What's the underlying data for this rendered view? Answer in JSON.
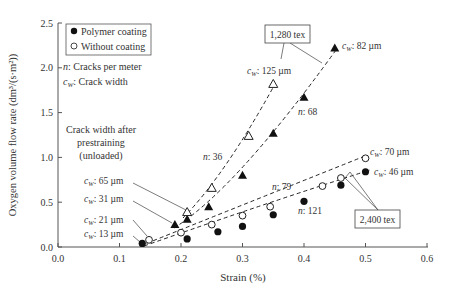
{
  "chart_data": {
    "type": "scatter",
    "title": "",
    "xlabel": "Strain (%)",
    "ylabel": "Oxygen volume flow rate (dm³/(s·m²))",
    "xlim": [
      0.0,
      0.6
    ],
    "ylim": [
      0.0,
      2.5
    ],
    "x_ticks": [
      "0.0",
      "0.1",
      "0.2",
      "0.3",
      "0.4",
      "0.5",
      "0.6"
    ],
    "y_ticks": [
      "0.0",
      "0.5",
      "1.0",
      "1.5",
      "2.0",
      "2.5"
    ],
    "grid": false,
    "legend": {
      "position": "upper left",
      "entries": [
        "Polymer coating",
        "Without coating"
      ]
    },
    "series": [
      {
        "name": "Polymer coating, 1,280 tex",
        "marker": "filled-triangle",
        "x": [
          0.19,
          0.21,
          0.245,
          0.3,
          0.35,
          0.4,
          0.45
        ],
        "y": [
          0.25,
          0.31,
          0.45,
          0.8,
          1.27,
          1.67,
          2.22
        ]
      },
      {
        "name": "Without coating, 1,280 tex",
        "marker": "open-triangle",
        "x": [
          0.21,
          0.25,
          0.31,
          0.35
        ],
        "y": [
          0.39,
          0.66,
          1.24,
          1.82
        ]
      },
      {
        "name": "Polymer coating, 2,400 tex",
        "marker": "filled-circle",
        "x": [
          0.137,
          0.21,
          0.26,
          0.3,
          0.35,
          0.4,
          0.46,
          0.5
        ],
        "y": [
          0.04,
          0.09,
          0.17,
          0.23,
          0.36,
          0.51,
          0.69,
          0.84
        ]
      },
      {
        "name": "Without coating, 2,400 tex",
        "marker": "open-circle",
        "x": [
          0.148,
          0.2,
          0.25,
          0.3,
          0.345,
          0.43,
          0.46,
          0.5
        ],
        "y": [
          0.08,
          0.16,
          0.25,
          0.35,
          0.45,
          0.68,
          0.77,
          0.99
        ]
      }
    ],
    "annotations": [
      "n: Cracks per meter",
      "cW: Crack width",
      "Crack width after prestraining (unloaded)",
      "cW: 65 µm",
      "cW: 31 µm",
      "cW: 21 µm",
      "cW: 13 µm",
      "cW: 125 µm",
      "cW: 82 µm",
      "cW: 70 µm",
      "cW: 46 µm",
      "n: 36",
      "n: 68",
      "n: 79",
      "n: 121",
      "1,280 tex",
      "2,400 tex"
    ]
  },
  "labels": {
    "xlabel": "Strain (%)",
    "ylabel": "Oxygen volume flow rate (dm³/(s·m²))",
    "legend_polymer": "Polymer coating",
    "legend_without": "Without coating",
    "n_def": ": Cracks per meter",
    "cw_def": ": Crack width",
    "prestrain_1": "Crack width after",
    "prestrain_2": "prestraining",
    "prestrain_3": "(unloaded)",
    "cw65": ": 65 µm",
    "cw31": ": 31 µm",
    "cw21": ": 21 µm",
    "cw13": ": 13 µm",
    "cw125": ": 125 µm",
    "cw82": ": 82 µm",
    "cw70": ": 70 µm",
    "cw46": ": 46 µm",
    "n36": ": 36",
    "n68": ": 68",
    "n79": ": 79",
    "n121": ": 121",
    "tex1280": "1,280 tex",
    "tex2400": "2,400 tex"
  },
  "ticks": {
    "x": [
      "0.0",
      "0.1",
      "0.2",
      "0.3",
      "0.4",
      "0.5",
      "0.6"
    ],
    "y": [
      "0.0",
      "0.5",
      "1.0",
      "1.5",
      "2.0",
      "2.5"
    ]
  }
}
